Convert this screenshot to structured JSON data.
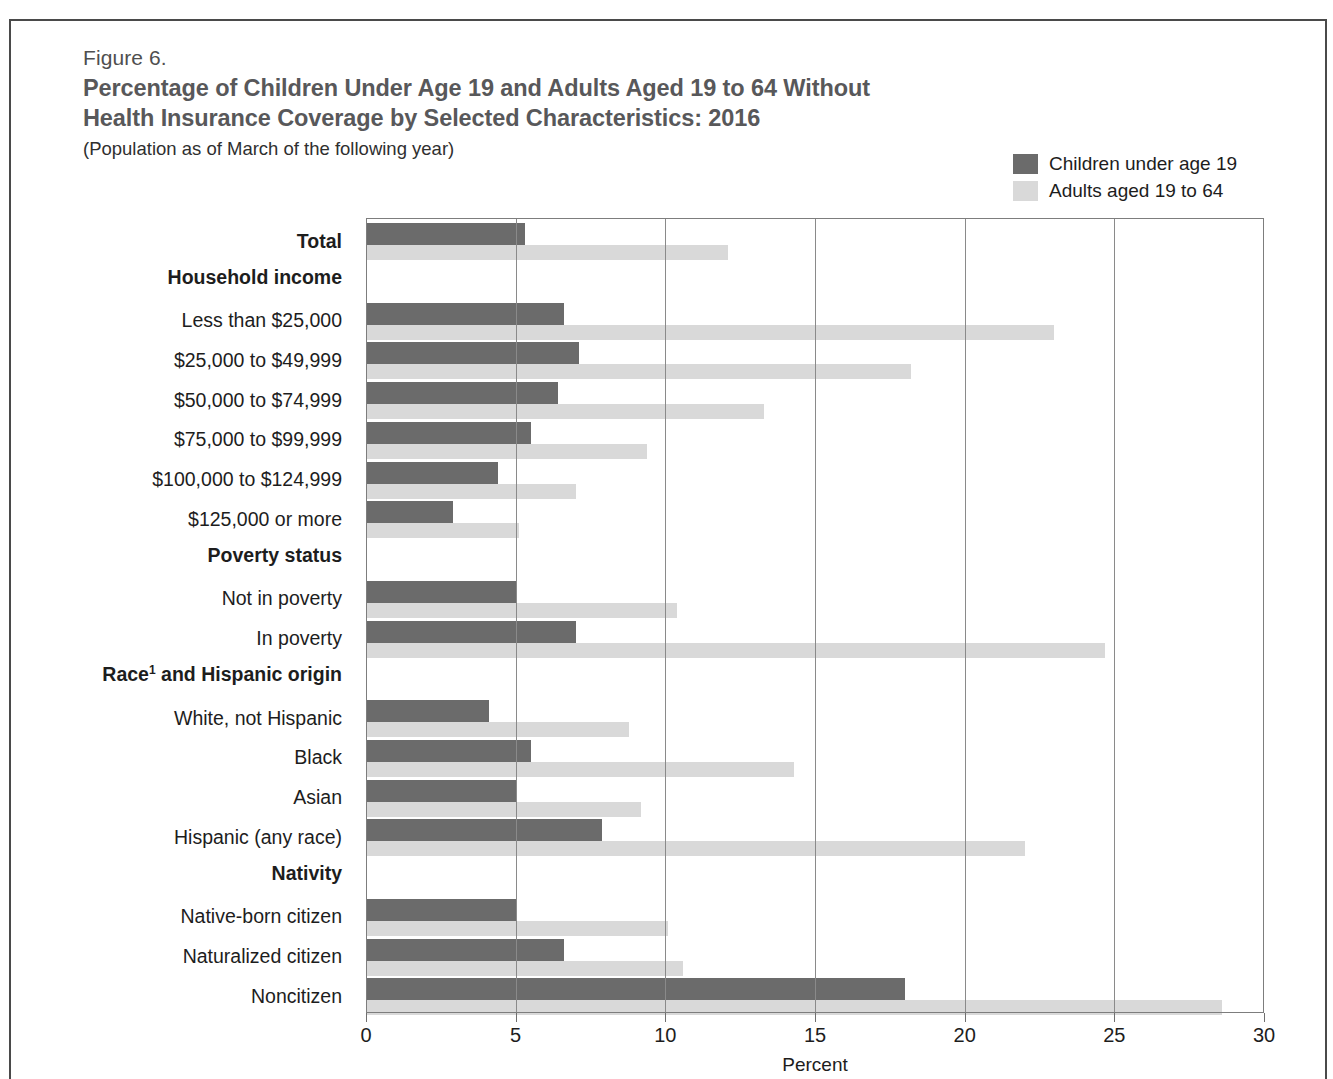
{
  "figure": {
    "number": "Figure 6.",
    "title_line1": "Percentage of Children Under Age 19 and Adults Aged 19 to 64 Without",
    "title_line2": "Health Insurance Coverage by Selected Characteristics: 2016",
    "subtitle": "(Population as of March of the following year)"
  },
  "colors": {
    "children": "#6b6b6b",
    "adults": "#d9d9d9",
    "title": "#58585a",
    "frame": "#4a4a4a",
    "grid": "#8a8a8a"
  },
  "legend": {
    "position": "top-right",
    "items": [
      {
        "label": "Children under age 19",
        "color": "#6b6b6b"
      },
      {
        "label": "Adults aged 19 to 64",
        "color": "#d9d9d9"
      }
    ]
  },
  "chart_data": {
    "type": "bar",
    "orientation": "horizontal",
    "title": "Percentage of Children Under Age 19 and Adults Aged 19 to 64 Without Health Insurance Coverage by Selected Characteristics: 2016",
    "subtitle": "(Population as of March of the following year)",
    "xlabel": "Percent",
    "ylabel": "",
    "xlim": [
      0,
      30
    ],
    "xticks": [
      0,
      5,
      10,
      15,
      20,
      25,
      30
    ],
    "xtick_labels": [
      "0",
      "5",
      "10",
      "15",
      "20",
      "25",
      "30"
    ],
    "grid": true,
    "grid_axis": "x",
    "legend_entries": [
      "Children under age 19",
      "Adults aged 19 to 64"
    ],
    "categories": [
      "Total",
      "Less than $25,000",
      "$25,000 to $49,999",
      "$50,000 to $74,999",
      "$75,000 to $99,999",
      "$100,000 to $124,999",
      "$125,000 or more",
      "Not in poverty",
      "In poverty",
      "White, not Hispanic",
      "Black",
      "Asian",
      "Hispanic (any race)",
      "Native-born citizen",
      "Naturalized citizen",
      "Noncitizen"
    ],
    "series": [
      {
        "name": "Children under age 19",
        "color": "#6b6b6b",
        "values": [
          5.3,
          6.6,
          7.1,
          6.4,
          5.5,
          4.4,
          2.9,
          5.0,
          7.0,
          4.1,
          5.5,
          5.0,
          7.9,
          5.0,
          6.6,
          18.0
        ]
      },
      {
        "name": "Adults aged 19 to 64",
        "color": "#d9d9d9",
        "values": [
          12.1,
          23.0,
          18.2,
          13.3,
          9.4,
          7.0,
          5.1,
          10.4,
          24.7,
          8.8,
          14.3,
          9.2,
          22.0,
          10.1,
          10.6,
          28.6
        ]
      }
    ],
    "group_headers": [
      {
        "label": "Household income",
        "before_category": "Less than $25,000"
      },
      {
        "label": "Poverty status",
        "before_category": "Not in poverty"
      },
      {
        "label": "Race¹ and Hispanic origin",
        "before_category": "White, not Hispanic"
      },
      {
        "label": "Nativity",
        "before_category": "Native-born citizen"
      }
    ]
  },
  "rows": [
    {
      "kind": "bars",
      "label": "Total",
      "bold": true,
      "children": 5.3,
      "adults": 12.1
    },
    {
      "kind": "group",
      "label": "Household income",
      "bold": true
    },
    {
      "kind": "bars",
      "label": "Less than $25,000",
      "bold": false,
      "children": 6.6,
      "adults": 23.0
    },
    {
      "kind": "bars",
      "label": "$25,000 to $49,999",
      "bold": false,
      "children": 7.1,
      "adults": 18.2
    },
    {
      "kind": "bars",
      "label": "$50,000 to $74,999",
      "bold": false,
      "children": 6.4,
      "adults": 13.3
    },
    {
      "kind": "bars",
      "label": "$75,000 to $99,999",
      "bold": false,
      "children": 5.5,
      "adults": 9.4
    },
    {
      "kind": "bars",
      "label": "$100,000 to $124,999",
      "bold": false,
      "children": 4.4,
      "adults": 7.0
    },
    {
      "kind": "bars",
      "label": "$125,000 or more",
      "bold": false,
      "children": 2.9,
      "adults": 5.1
    },
    {
      "kind": "group",
      "label": "Poverty status",
      "bold": true
    },
    {
      "kind": "bars",
      "label": "Not in poverty",
      "bold": false,
      "children": 5.0,
      "adults": 10.4
    },
    {
      "kind": "bars",
      "label": "In poverty",
      "bold": false,
      "children": 7.0,
      "adults": 24.7
    },
    {
      "kind": "group",
      "label": "Race¹ and Hispanic origin",
      "bold": true,
      "sup": "1",
      "base": "Race",
      "rest": " and Hispanic origin"
    },
    {
      "kind": "bars",
      "label": "White, not Hispanic",
      "bold": false,
      "children": 4.1,
      "adults": 8.8
    },
    {
      "kind": "bars",
      "label": "Black",
      "bold": false,
      "children": 5.5,
      "adults": 14.3
    },
    {
      "kind": "bars",
      "label": "Asian",
      "bold": false,
      "children": 5.0,
      "adults": 9.2
    },
    {
      "kind": "bars",
      "label": "Hispanic (any race)",
      "bold": false,
      "children": 7.9,
      "adults": 22.0
    },
    {
      "kind": "group",
      "label": "Nativity",
      "bold": true
    },
    {
      "kind": "bars",
      "label": "Native-born citizen",
      "bold": false,
      "children": 5.0,
      "adults": 10.1
    },
    {
      "kind": "bars",
      "label": "Naturalized citizen",
      "bold": false,
      "children": 6.6,
      "adults": 10.6
    },
    {
      "kind": "bars",
      "label": "Noncitizen",
      "bold": false,
      "children": 18.0,
      "adults": 28.6
    }
  ],
  "xaxis": {
    "title": "Percent",
    "ticks": [
      "0",
      "5",
      "10",
      "15",
      "20",
      "25",
      "30"
    ]
  }
}
